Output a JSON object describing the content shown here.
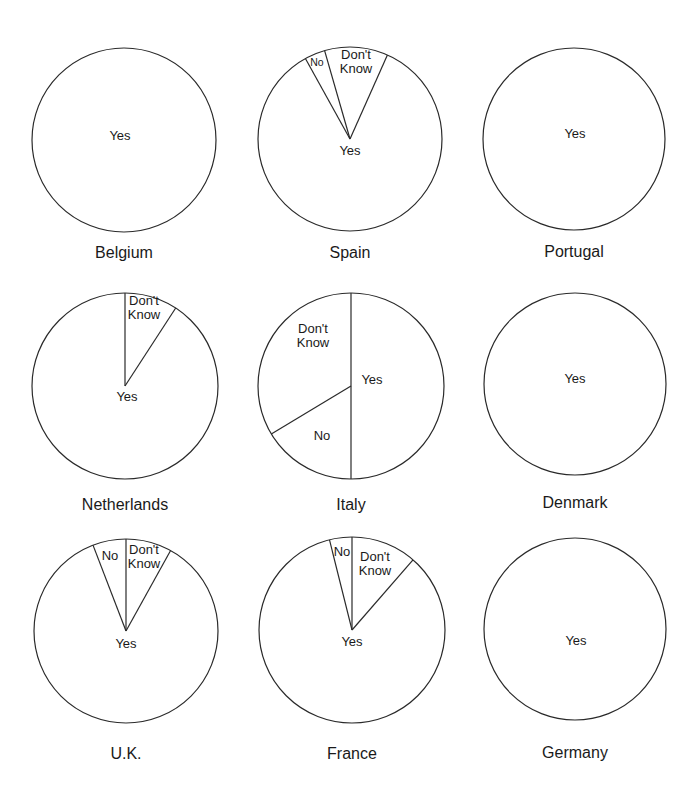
{
  "colors": {
    "stroke": "#2a2a2a",
    "text": "#1a1a1a",
    "background": "#ffffff"
  },
  "chart_data": {
    "type": "pie",
    "title": "",
    "layout": "3x3 grid of pie charts",
    "angle_convention": "degrees clockwise from 12 o'clock",
    "charts": [
      {
        "country": "Belgium",
        "cx": 124,
        "cy": 140,
        "r": 92,
        "label_y": 254,
        "slices": [
          {
            "label": "Yes",
            "value": 100,
            "start": 0,
            "end": 360,
            "lx": 120,
            "ly": 137,
            "lines": [
              "Yes"
            ]
          }
        ]
      },
      {
        "country": "Spain",
        "cx": 350,
        "cy": 139,
        "r": 92,
        "label_y": 254,
        "slices": [
          {
            "label": "Yes",
            "value": 85,
            "start": 24,
            "end": 331,
            "lx": 350,
            "ly": 152,
            "lines": [
              "Yes"
            ]
          },
          {
            "label": "No",
            "value": 4,
            "start": 331,
            "end": 344,
            "lx": 317,
            "ly": 63,
            "lines": [
              "No"
            ],
            "small": true
          },
          {
            "label": "Don't Know",
            "value": 11,
            "start": 344,
            "end": 384,
            "lx": 356,
            "ly": 63,
            "lines": [
              "Don't",
              "Know"
            ]
          }
        ]
      },
      {
        "country": "Portugal",
        "cx": 574,
        "cy": 139,
        "r": 91,
        "label_y": 253,
        "slices": [
          {
            "label": "Yes",
            "value": 100,
            "start": 0,
            "end": 360,
            "lx": 575,
            "ly": 135,
            "lines": [
              "Yes"
            ]
          }
        ]
      },
      {
        "country": "Netherlands",
        "cx": 125,
        "cy": 386,
        "r": 93,
        "label_y": 506,
        "slices": [
          {
            "label": "Yes",
            "value": 91,
            "start": 33,
            "end": 360,
            "lx": 127,
            "ly": 398,
            "lines": [
              "Yes"
            ]
          },
          {
            "label": "Don't Know",
            "value": 9,
            "start": 0,
            "end": 33,
            "lx": 144,
            "ly": 309,
            "lines": [
              "Don't",
              "Know"
            ]
          }
        ]
      },
      {
        "country": "Italy",
        "cx": 351,
        "cy": 386,
        "r": 93,
        "label_y": 506,
        "slices": [
          {
            "label": "Yes",
            "value": 50,
            "start": 0,
            "end": 180,
            "lx": 372,
            "ly": 381,
            "lines": [
              "Yes"
            ]
          },
          {
            "label": "No",
            "value": 16,
            "start": 180,
            "end": 239,
            "lx": 322,
            "ly": 437,
            "lines": [
              "No"
            ]
          },
          {
            "label": "Don't Know",
            "value": 34,
            "start": 239,
            "end": 360,
            "lx": 313,
            "ly": 337,
            "lines": [
              "Don't",
              "Know"
            ]
          }
        ]
      },
      {
        "country": "Denmark",
        "cx": 575,
        "cy": 384,
        "r": 91,
        "label_y": 504,
        "slices": [
          {
            "label": "Yes",
            "value": 100,
            "start": 0,
            "end": 360,
            "lx": 575,
            "ly": 380,
            "lines": [
              "Yes"
            ]
          }
        ]
      },
      {
        "country": "U.K.",
        "cx": 126,
        "cy": 631,
        "r": 92,
        "label_y": 755,
        "slices": [
          {
            "label": "Yes",
            "value": 86,
            "start": 29,
            "end": 339,
            "lx": 126,
            "ly": 645,
            "lines": [
              "Yes"
            ]
          },
          {
            "label": "No",
            "value": 6,
            "start": 339,
            "end": 360,
            "lx": 110,
            "ly": 557,
            "lines": [
              "No"
            ]
          },
          {
            "label": "Don't Know",
            "value": 8,
            "start": 0,
            "end": 29,
            "lx": 144,
            "ly": 558,
            "lines": [
              "Don't",
              "Know"
            ]
          }
        ]
      },
      {
        "country": "France",
        "cx": 352,
        "cy": 630,
        "r": 93,
        "label_y": 755,
        "slices": [
          {
            "label": "Yes",
            "value": 85,
            "start": 41,
            "end": 346,
            "lx": 352,
            "ly": 643,
            "lines": [
              "Yes"
            ]
          },
          {
            "label": "No",
            "value": 4,
            "start": 346,
            "end": 360,
            "lx": 342,
            "ly": 553,
            "lines": [
              "No"
            ]
          },
          {
            "label": "Don't Know",
            "value": 11,
            "start": 0,
            "end": 41,
            "lx": 375,
            "ly": 565,
            "lines": [
              "Don't",
              "Know"
            ]
          }
        ]
      },
      {
        "country": "Germany",
        "cx": 575,
        "cy": 629,
        "r": 91,
        "label_y": 754,
        "slices": [
          {
            "label": "Yes",
            "value": 100,
            "start": 0,
            "end": 360,
            "lx": 576,
            "ly": 642,
            "lines": [
              "Yes"
            ]
          }
        ]
      }
    ]
  }
}
